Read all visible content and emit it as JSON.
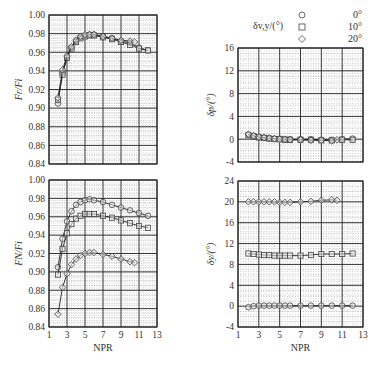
{
  "legend": {
    "title": "δv,y/(°)",
    "entries": [
      {
        "marker": "circle",
        "label": "0°"
      },
      {
        "marker": "square",
        "label": "10°"
      },
      {
        "marker": "diamond",
        "label": "20°"
      }
    ]
  },
  "chart_data": [
    {
      "id": "top-left",
      "type": "line",
      "ylabel": "Fr/Fi",
      "xlabel": "",
      "xlim": [
        1,
        13
      ],
      "ylim": [
        0.84,
        1.0
      ],
      "xticks": [
        1,
        3,
        5,
        7,
        9,
        11,
        13
      ],
      "yticks": [
        "0.84",
        "0.86",
        "0.88",
        "0.90",
        "0.92",
        "0.94",
        "0.96",
        "0.98",
        "1.00"
      ],
      "show_xticklabels": false,
      "grid": true,
      "series": [
        {
          "name": "0°",
          "marker": "circle",
          "x": [
            2.0,
            2.5,
            3.0,
            3.5,
            4.0,
            4.5,
            5.0,
            5.5,
            6.0,
            7.0,
            8.0,
            9.0,
            10.0,
            11.0,
            12.0
          ],
          "y": [
            0.905,
            0.938,
            0.955,
            0.965,
            0.972,
            0.976,
            0.978,
            0.979,
            0.979,
            0.977,
            0.975,
            0.972,
            0.97,
            0.965,
            0.962
          ]
        },
        {
          "name": "10°",
          "marker": "square",
          "x": [
            2.0,
            2.5,
            3.0,
            3.5,
            4.0,
            4.5,
            5.0,
            5.5,
            6.0,
            7.0,
            8.0,
            9.0,
            10.0,
            11.0,
            12.0
          ],
          "y": [
            0.909,
            0.936,
            0.954,
            0.964,
            0.971,
            0.975,
            0.977,
            0.978,
            0.978,
            0.976,
            0.974,
            0.971,
            0.968,
            0.964,
            0.962
          ]
        },
        {
          "name": "20°",
          "marker": "diamond",
          "x": [
            2.0,
            2.5,
            3.0,
            3.5,
            4.0,
            4.5,
            5.0,
            5.5,
            6.0,
            7.0,
            8.0,
            9.0,
            10.0,
            10.5
          ],
          "y": [
            0.911,
            0.941,
            0.956,
            0.966,
            0.973,
            0.977,
            0.979,
            0.979,
            0.979,
            0.977,
            0.975,
            0.973,
            0.972,
            0.971
          ]
        }
      ]
    },
    {
      "id": "bottom-left",
      "type": "line",
      "ylabel": "FN/Fi",
      "xlabel": "NPR",
      "xlim": [
        1,
        13
      ],
      "ylim": [
        0.84,
        1.0
      ],
      "xticks": [
        1,
        3,
        5,
        7,
        9,
        11,
        13
      ],
      "yticks": [
        "0.84",
        "0.86",
        "0.88",
        "0.90",
        "0.92",
        "0.94",
        "0.96",
        "0.98",
        "1.00"
      ],
      "show_xticklabels": true,
      "grid": true,
      "series": [
        {
          "name": "0°",
          "marker": "circle",
          "x": [
            2.0,
            2.5,
            3.0,
            3.5,
            4.0,
            4.5,
            5.0,
            5.5,
            6.0,
            7.0,
            8.0,
            9.0,
            10.0,
            11.0,
            12.0
          ],
          "y": [
            0.905,
            0.936,
            0.955,
            0.966,
            0.973,
            0.976,
            0.978,
            0.979,
            0.978,
            0.976,
            0.973,
            0.97,
            0.967,
            0.964,
            0.961
          ]
        },
        {
          "name": "10°",
          "marker": "square",
          "x": [
            2.0,
            2.5,
            3.0,
            3.5,
            4.0,
            4.5,
            5.0,
            5.5,
            6.0,
            7.0,
            8.0,
            9.0,
            10.0,
            11.0,
            12.0
          ],
          "y": [
            0.897,
            0.925,
            0.942,
            0.952,
            0.958,
            0.961,
            0.963,
            0.963,
            0.963,
            0.961,
            0.959,
            0.956,
            0.953,
            0.95,
            0.948
          ]
        },
        {
          "name": "20°",
          "marker": "diamond",
          "x": [
            2.0,
            2.5,
            3.0,
            3.5,
            4.0,
            4.5,
            5.0,
            5.5,
            6.0,
            7.0,
            8.0,
            9.0,
            10.0,
            10.5
          ],
          "y": [
            0.854,
            0.883,
            0.898,
            0.908,
            0.914,
            0.918,
            0.92,
            0.921,
            0.921,
            0.919,
            0.917,
            0.914,
            0.911,
            0.91
          ]
        }
      ]
    },
    {
      "id": "top-right",
      "type": "line",
      "ylabel": "δp/(°)",
      "xlabel": "",
      "xlim": [
        1,
        13
      ],
      "ylim": [
        -4,
        16
      ],
      "xticks": [
        1,
        3,
        5,
        7,
        9,
        11,
        13
      ],
      "yticks": [
        "-4",
        "0",
        "4",
        "8",
        "12",
        "16"
      ],
      "show_xticklabels": false,
      "grid": true,
      "series": [
        {
          "name": "0°",
          "marker": "circle",
          "x": [
            2.0,
            2.5,
            3.0,
            3.5,
            4.0,
            4.5,
            5.0,
            5.5,
            6.0,
            7.0,
            8.0,
            9.0,
            10.0,
            11.0,
            12.0
          ],
          "y": [
            0.8,
            0.6,
            0.4,
            0.3,
            0.2,
            0.1,
            0.1,
            0.0,
            0.0,
            0.0,
            0.0,
            -0.1,
            -0.1,
            0.0,
            0.1
          ]
        },
        {
          "name": "10°",
          "marker": "square",
          "x": [
            2.0,
            2.5,
            3.0,
            3.5,
            4.0,
            4.5,
            5.0,
            5.5,
            6.0,
            7.0,
            8.0,
            9.0,
            10.0,
            11.0,
            12.0
          ],
          "y": [
            0.7,
            0.5,
            0.3,
            0.2,
            0.1,
            0.0,
            0.0,
            -0.1,
            -0.1,
            -0.1,
            -0.1,
            -0.2,
            -0.2,
            -0.1,
            -0.1
          ]
        },
        {
          "name": "20°",
          "marker": "diamond",
          "x": [
            2.0,
            2.5,
            3.0,
            3.5,
            4.0,
            4.5,
            5.0,
            5.5,
            6.0,
            7.0,
            8.0,
            9.0,
            10.0,
            10.5
          ],
          "y": [
            0.9,
            0.6,
            0.4,
            0.3,
            0.2,
            0.1,
            0.0,
            0.0,
            -0.1,
            -0.1,
            -0.2,
            -0.2,
            -0.3,
            -0.1
          ]
        }
      ]
    },
    {
      "id": "bottom-right",
      "type": "line",
      "ylabel": "δy/(°)",
      "xlabel": "NPR",
      "xlim": [
        1,
        13
      ],
      "ylim": [
        -4,
        24
      ],
      "xticks": [
        1,
        3,
        5,
        7,
        9,
        11,
        13
      ],
      "yticks": [
        "-4",
        "0",
        "4",
        "8",
        "12",
        "16",
        "20",
        "24"
      ],
      "show_xticklabels": true,
      "grid": true,
      "series": [
        {
          "name": "0°",
          "marker": "circle",
          "x": [
            2.0,
            2.5,
            3.0,
            3.5,
            4.0,
            4.5,
            5.0,
            5.5,
            6.0,
            7.0,
            8.0,
            9.0,
            10.0,
            11.0,
            12.0
          ],
          "y": [
            -0.2,
            0.0,
            0.1,
            0.1,
            0.1,
            0.1,
            0.1,
            0.1,
            0.1,
            0.1,
            0.1,
            0.1,
            0.1,
            0.1,
            0.1
          ]
        },
        {
          "name": "10°",
          "marker": "square",
          "x": [
            2.0,
            2.5,
            3.0,
            3.5,
            4.0,
            4.5,
            5.0,
            5.5,
            6.0,
            7.0,
            8.0,
            9.0,
            10.0,
            11.0,
            12.0
          ],
          "y": [
            10.1,
            10.0,
            9.9,
            9.8,
            9.8,
            9.7,
            9.7,
            9.7,
            9.7,
            9.7,
            9.8,
            10.0,
            10.0,
            10.0,
            10.1
          ]
        },
        {
          "name": "20°",
          "marker": "diamond",
          "x": [
            2.0,
            2.5,
            3.0,
            3.5,
            4.0,
            4.5,
            5.0,
            5.5,
            6.0,
            7.0,
            8.0,
            9.0,
            10.0,
            10.5
          ],
          "y": [
            20.0,
            20.0,
            20.0,
            20.0,
            20.0,
            20.0,
            19.9,
            19.9,
            19.9,
            20.0,
            20.1,
            20.3,
            20.4,
            20.3
          ]
        }
      ]
    }
  ]
}
